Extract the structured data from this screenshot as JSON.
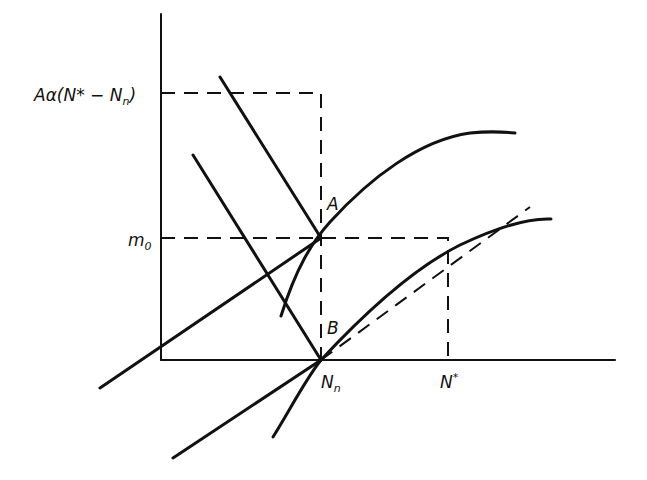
{
  "diagram": {
    "type": "economics-line-diagram",
    "labels": {
      "y_top": "Aα(N* − N",
      "y_top_sub": "n",
      "y_top_close": ")",
      "m0": "m",
      "m0_sub": "0",
      "point_a": "A",
      "point_b": "B",
      "nn": "N",
      "nn_sub": "n",
      "nstar": "N",
      "nstar_sup": "*"
    },
    "colors": {
      "ink": "#111111",
      "background": "#ffffff"
    }
  }
}
